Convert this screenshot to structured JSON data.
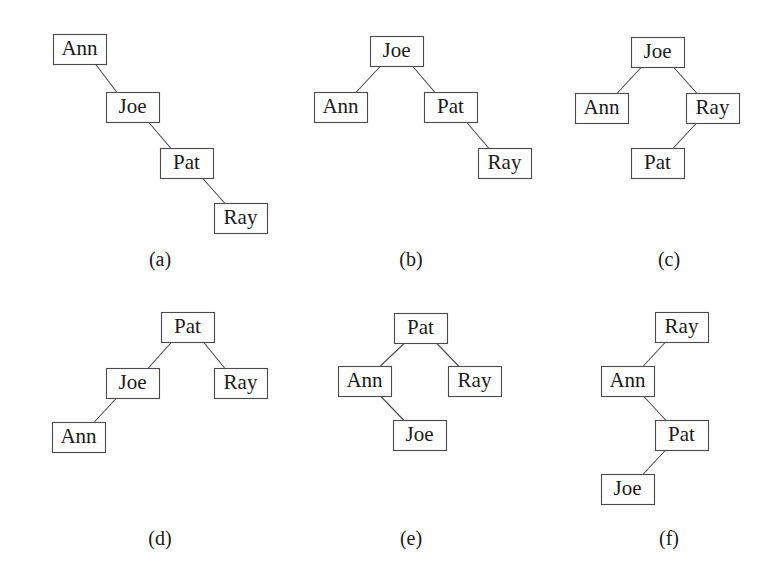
{
  "figure": {
    "background_color": "#ffffff",
    "box_stroke_color": "#4a4a4a",
    "text_color": "#1a1a1a",
    "box_width": 53,
    "box_height": 30
  },
  "panels": [
    {
      "id": "a",
      "caption": "(a)",
      "caption_x": 160,
      "caption_y": 266,
      "nodes": [
        {
          "key": "ann",
          "label": "Ann",
          "x": 53,
          "y": 34
        },
        {
          "key": "joe",
          "label": "Joe",
          "x": 106,
          "y": 92
        },
        {
          "key": "pat",
          "label": "Pat",
          "x": 160,
          "y": 148
        },
        {
          "key": "ray",
          "label": "Ray",
          "x": 214,
          "y": 203
        }
      ],
      "edges": [
        {
          "from": "ann",
          "to": "joe",
          "side": "right"
        },
        {
          "from": "joe",
          "to": "pat",
          "side": "right"
        },
        {
          "from": "pat",
          "to": "ray",
          "side": "right"
        }
      ]
    },
    {
      "id": "b",
      "caption": "(b)",
      "caption_x": 411,
      "caption_y": 266,
      "nodes": [
        {
          "key": "joe",
          "label": "Joe",
          "x": 370,
          "y": 36
        },
        {
          "key": "ann",
          "label": "Ann",
          "x": 314,
          "y": 92
        },
        {
          "key": "pat",
          "label": "Pat",
          "x": 424,
          "y": 92
        },
        {
          "key": "ray",
          "label": "Ray",
          "x": 478,
          "y": 148
        }
      ],
      "edges": [
        {
          "from": "joe",
          "to": "ann",
          "side": "left"
        },
        {
          "from": "joe",
          "to": "pat",
          "side": "right"
        },
        {
          "from": "pat",
          "to": "ray",
          "side": "right"
        }
      ]
    },
    {
      "id": "c",
      "caption": "(c)",
      "caption_x": 669,
      "caption_y": 266,
      "nodes": [
        {
          "key": "joe",
          "label": "Joe",
          "x": 631,
          "y": 37
        },
        {
          "key": "ann",
          "label": "Ann",
          "x": 575,
          "y": 93
        },
        {
          "key": "ray",
          "label": "Ray",
          "x": 686,
          "y": 93
        },
        {
          "key": "pat",
          "label": "Pat",
          "x": 631,
          "y": 148
        }
      ],
      "edges": [
        {
          "from": "joe",
          "to": "ann",
          "side": "left"
        },
        {
          "from": "joe",
          "to": "ray",
          "side": "right"
        },
        {
          "from": "ray",
          "to": "pat",
          "side": "left"
        }
      ]
    },
    {
      "id": "d",
      "caption": "(d)",
      "caption_x": 160,
      "caption_y": 545,
      "nodes": [
        {
          "key": "pat",
          "label": "Pat",
          "x": 161,
          "y": 312
        },
        {
          "key": "joe",
          "label": "Joe",
          "x": 106,
          "y": 368
        },
        {
          "key": "ray",
          "label": "Ray",
          "x": 214,
          "y": 368
        },
        {
          "key": "ann",
          "label": "Ann",
          "x": 52,
          "y": 422
        }
      ],
      "edges": [
        {
          "from": "pat",
          "to": "joe",
          "side": "left"
        },
        {
          "from": "pat",
          "to": "ray",
          "side": "right"
        },
        {
          "from": "joe",
          "to": "ann",
          "side": "left"
        }
      ]
    },
    {
      "id": "e",
      "caption": "(e)",
      "caption_x": 411,
      "caption_y": 545,
      "nodes": [
        {
          "key": "pat",
          "label": "Pat",
          "x": 394,
          "y": 313
        },
        {
          "key": "ann",
          "label": "Ann",
          "x": 338,
          "y": 366
        },
        {
          "key": "ray",
          "label": "Ray",
          "x": 448,
          "y": 366
        },
        {
          "key": "joe",
          "label": "Joe",
          "x": 393,
          "y": 420
        }
      ],
      "edges": [
        {
          "from": "pat",
          "to": "ann",
          "side": "left"
        },
        {
          "from": "pat",
          "to": "ray",
          "side": "right"
        },
        {
          "from": "ann",
          "to": "joe",
          "side": "right"
        }
      ]
    },
    {
      "id": "f",
      "caption": "(f)",
      "caption_x": 669,
      "caption_y": 545,
      "nodes": [
        {
          "key": "ray",
          "label": "Ray",
          "x": 655,
          "y": 312
        },
        {
          "key": "ann",
          "label": "Ann",
          "x": 601,
          "y": 366
        },
        {
          "key": "pat",
          "label": "Pat",
          "x": 655,
          "y": 420
        },
        {
          "key": "joe",
          "label": "Joe",
          "x": 601,
          "y": 474
        }
      ],
      "edges": [
        {
          "from": "ray",
          "to": "ann",
          "side": "left"
        },
        {
          "from": "ann",
          "to": "pat",
          "side": "right"
        },
        {
          "from": "pat",
          "to": "joe",
          "side": "left"
        }
      ]
    }
  ]
}
